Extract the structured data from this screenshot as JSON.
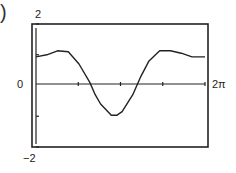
{
  "figure": {
    "label_fragment": ")"
  },
  "axes": {
    "y_max_label": "2",
    "y_zero_label": "0",
    "y_min_label": "−2",
    "x_max_label": "2π"
  },
  "chart_data": {
    "type": "line",
    "title": "",
    "xlabel": "",
    "ylabel": "",
    "xlim": [
      0,
      6.283
    ],
    "ylim": [
      -2,
      2
    ],
    "x_tick_labels": [
      "2π"
    ],
    "y_tick_labels": [
      "2",
      "0",
      "−2"
    ],
    "grid": false,
    "legend": "none",
    "series": [
      {
        "name": "f(x)",
        "x": [
          0,
          0.4,
          0.8,
          1.2,
          1.6,
          2.0,
          2.2,
          2.4,
          2.8,
          3.0,
          3.2,
          3.6,
          3.9,
          4.2,
          4.6,
          5.0,
          5.4,
          5.8,
          6.283
        ],
        "y": [
          0.93,
          1.0,
          1.13,
          1.1,
          0.7,
          0.1,
          -0.3,
          -0.6,
          -0.97,
          -0.97,
          -0.85,
          -0.3,
          0.3,
          0.8,
          1.13,
          1.13,
          1.05,
          0.93,
          0.93
        ]
      }
    ]
  }
}
